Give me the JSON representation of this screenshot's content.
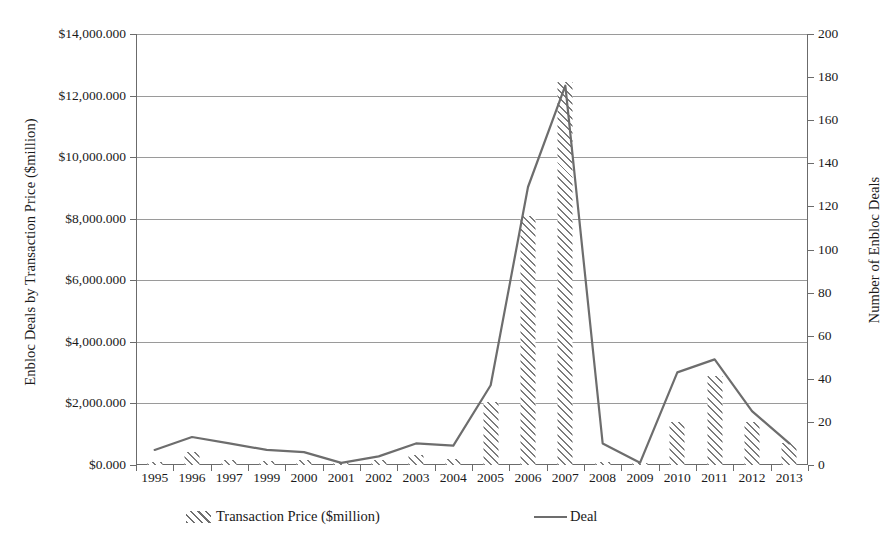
{
  "chart_data": {
    "type": "bar",
    "title": "",
    "subtitle": "",
    "xlabel": "",
    "ylabel": "Enbloc Deals by Transaction Price ($million)",
    "y2label": "Number of Enbloc Deals",
    "grid": true,
    "legend_position": "bottom",
    "categories": [
      "1995",
      "1996",
      "1997",
      "1999",
      "2000",
      "2001",
      "2002",
      "2003",
      "2004",
      "2005",
      "2006",
      "2007",
      "2008",
      "2009",
      "2010",
      "2011",
      "2012",
      "2013"
    ],
    "ylim": [
      0,
      14000
    ],
    "yticks": [
      0,
      2000,
      4000,
      6000,
      8000,
      10000,
      12000,
      14000
    ],
    "ytick_labels": [
      "$0.000",
      "$2,000.000",
      "$4,000.000",
      "$6,000.000",
      "$8,000.000",
      "$10,000.000",
      "$12,000.000",
      "$14,000.000"
    ],
    "y2lim": [
      0,
      200
    ],
    "y2ticks": [
      0,
      20,
      40,
      60,
      80,
      100,
      120,
      140,
      160,
      180,
      200
    ],
    "y2tick_labels": [
      "0",
      "20",
      "40",
      "60",
      "80",
      "100",
      "120",
      "140",
      "160",
      "180",
      "200"
    ],
    "series": [
      {
        "name": "Transaction Price ($million)",
        "type": "bar",
        "axis": "left",
        "color": "#7c7c7c",
        "fill": "diagonal-hatch",
        "values": [
          90,
          420,
          150,
          130,
          180,
          60,
          170,
          320,
          200,
          2050,
          8100,
          12450,
          100,
          60,
          1400,
          2900,
          1400,
          700
        ]
      },
      {
        "name": "Deal",
        "type": "line",
        "axis": "right",
        "color": "#6d6d6d",
        "values": [
          7,
          13,
          10,
          7,
          6,
          1,
          4,
          10,
          9,
          37,
          129,
          176,
          10,
          1,
          43,
          49,
          25,
          10
        ]
      }
    ]
  },
  "axes": {
    "left_title": "Enbloc Deals by Transaction Price ($million)",
    "right_title": "Number of Enbloc Deals"
  },
  "legend": {
    "bar_label": "Transaction Price ($million)",
    "line_label": "Deal"
  }
}
